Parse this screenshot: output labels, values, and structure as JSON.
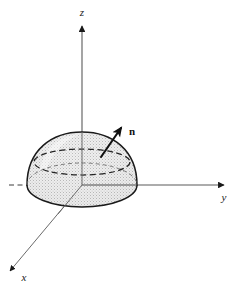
{
  "figure": {
    "background_color": "#ffffff",
    "width": 245,
    "height": 291
  },
  "axes": {
    "origin": {
      "x": 82,
      "y": 185
    },
    "stroke_color": "#4d4d4d",
    "arrow_color": "#1a1a1a",
    "items": [
      {
        "name": "z",
        "label": "z",
        "label_x": 82,
        "label_y": 14,
        "direction": "up",
        "tip_x": 82,
        "tip_y": 22,
        "style": "solid"
      },
      {
        "name": "y",
        "label": "y",
        "label_x": 224,
        "label_y": 199,
        "direction": "right",
        "tip_x": 228,
        "tip_y": 185,
        "style": "solid"
      },
      {
        "name": "x",
        "label": "x",
        "label_x": 23,
        "label_y": 280,
        "direction": "down-left",
        "tip_x": 6,
        "tip_y": 275,
        "style": "solid"
      }
    ],
    "hidden_axis": {
      "name": "y-negative",
      "style": "dashed",
      "from_x": 9,
      "from_y": 185,
      "to_x": 82,
      "to_y": 185
    }
  },
  "surface": {
    "name": "paraboloid-dome",
    "apex": {
      "x": 82,
      "y": 132
    },
    "base_center": {
      "x": 82,
      "y": 185
    },
    "base_rx": 55,
    "base_ry": 22,
    "fill_color": "#e8e8e8",
    "stipple_color": "#9a9a9a",
    "outline_color": "#1a1a1a",
    "equator": {
      "name": "hidden-cross-section",
      "center_x": 82,
      "center_y": 162,
      "rx": 48,
      "ry": 13,
      "style": "dashed",
      "color": "#2b2b2b"
    }
  },
  "normal_vector": {
    "name": "n",
    "label": "n",
    "label_x": 131,
    "label_y": 133,
    "tail_x": 101,
    "tail_y": 157,
    "tip_x": 124,
    "tip_y": 124,
    "color": "#111111"
  }
}
